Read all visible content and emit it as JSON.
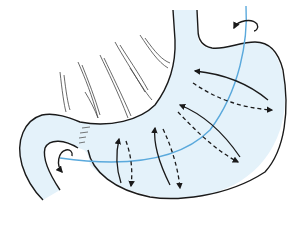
{
  "diagram": {
    "colors": {
      "fill": "#e4f2fa",
      "outline": "#1a1a1a",
      "axis": "#5aa9dc",
      "arrow": "#1a1a1a"
    },
    "elements": [
      {
        "name": "esophagus",
        "type": "tube"
      },
      {
        "name": "stomach-body",
        "type": "organ-outline"
      },
      {
        "name": "duodenum",
        "type": "tube"
      },
      {
        "name": "longitudinal-axis",
        "type": "curve"
      },
      {
        "name": "rotation-arrow-top",
        "type": "curved-arrow"
      },
      {
        "name": "rotation-arrow-pylorus",
        "type": "curved-arrow"
      },
      {
        "name": "rotation-arrows",
        "type": "paired-solid-dashed-arrows",
        "count": 4
      },
      {
        "name": "omentum-strands",
        "type": "hatching"
      }
    ]
  }
}
